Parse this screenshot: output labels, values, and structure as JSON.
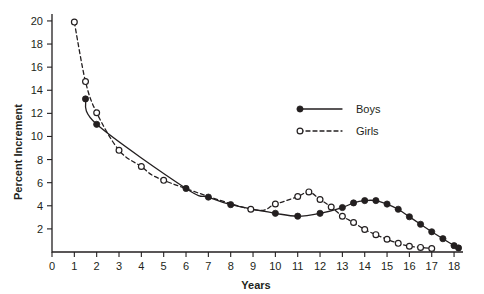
{
  "chart_data": {
    "type": "line",
    "title": "",
    "xlabel": "Years",
    "ylabel": "Percent Increment",
    "xlim": [
      0,
      18.4
    ],
    "ylim": [
      0,
      20.6
    ],
    "grid": false,
    "legend_position": "upper-right",
    "x_ticks": [
      0,
      1,
      2,
      3,
      4,
      5,
      6,
      7,
      8,
      9,
      10,
      11,
      12,
      13,
      14,
      15,
      16,
      17,
      18
    ],
    "x_tick_labels": [
      "0",
      "1",
      "2",
      "3",
      "4",
      "5",
      "6",
      "7",
      "8",
      "9",
      "10",
      "11",
      "12",
      "13",
      "14",
      "15",
      "16",
      "17",
      "18"
    ],
    "y_ticks": [
      2,
      4,
      6,
      8,
      10,
      12,
      14,
      16,
      18,
      20
    ],
    "y_tick_labels": [
      "2",
      "4",
      "6",
      "8",
      "10",
      "12",
      "14",
      "16",
      "18",
      "20"
    ],
    "series": [
      {
        "name": "Boys",
        "marker": "filled-circle",
        "linestyle": "solid",
        "color": "#231f20",
        "points": [
          [
            1.5,
            13.25
          ],
          [
            2.0,
            11.05
          ],
          [
            6.0,
            5.5
          ],
          [
            7.0,
            4.75
          ],
          [
            8.0,
            4.1
          ],
          [
            10.0,
            3.35
          ],
          [
            11.0,
            3.1
          ],
          [
            12.0,
            3.35
          ],
          [
            13.0,
            3.85
          ],
          [
            13.5,
            4.25
          ],
          [
            14.0,
            4.45
          ],
          [
            14.5,
            4.45
          ],
          [
            15.0,
            4.15
          ],
          [
            15.5,
            3.7
          ],
          [
            16.0,
            3.05
          ],
          [
            16.5,
            2.4
          ],
          [
            17.0,
            1.75
          ],
          [
            17.5,
            1.15
          ],
          [
            18.0,
            0.55
          ],
          [
            18.2,
            0.35
          ]
        ]
      },
      {
        "name": "Girls",
        "marker": "open-circle",
        "linestyle": "dashed",
        "color": "#231f20",
        "points": [
          [
            1.0,
            19.9
          ],
          [
            1.5,
            14.75
          ],
          [
            2.0,
            12.05
          ],
          [
            3.0,
            8.8
          ],
          [
            4.0,
            7.4
          ],
          [
            5.0,
            6.2
          ],
          [
            8.9,
            3.7
          ],
          [
            10.0,
            4.15
          ],
          [
            11.0,
            4.8
          ],
          [
            11.5,
            5.2
          ],
          [
            12.0,
            4.55
          ],
          [
            12.5,
            3.9
          ],
          [
            13.0,
            3.1
          ],
          [
            13.5,
            2.55
          ],
          [
            14.0,
            1.95
          ],
          [
            14.5,
            1.5
          ],
          [
            15.0,
            1.1
          ],
          [
            15.5,
            0.75
          ],
          [
            16.0,
            0.5
          ],
          [
            16.5,
            0.4
          ],
          [
            17.0,
            0.3
          ]
        ]
      }
    ],
    "legend": [
      {
        "label": "Boys",
        "marker": "filled-circle",
        "linestyle": "solid"
      },
      {
        "label": "Girls",
        "marker": "open-circle",
        "linestyle": "dashed"
      }
    ]
  }
}
